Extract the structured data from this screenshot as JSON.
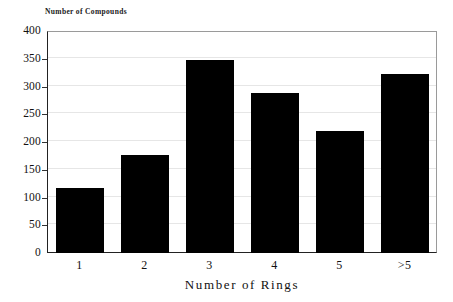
{
  "chart_data": {
    "type": "bar",
    "title": "",
    "categories": [
      "1",
      "2",
      "3",
      "4",
      "5",
      ">5"
    ],
    "values": [
      117,
      176,
      348,
      288,
      219,
      323
    ],
    "xlabel": "Number of Rings",
    "ylabel": "Number of Compounds",
    "ylim": [
      0,
      400
    ],
    "yticks": [
      0,
      50,
      100,
      150,
      200,
      250,
      300,
      350,
      400
    ],
    "ytick_labels": [
      "0",
      "50",
      "100",
      "150",
      "200",
      "250",
      "300",
      "350",
      "400"
    ],
    "grid": true,
    "legend": false,
    "bar_color": "#000000",
    "grid_color": "#e6e6e6",
    "axis_color": "#222222"
  }
}
